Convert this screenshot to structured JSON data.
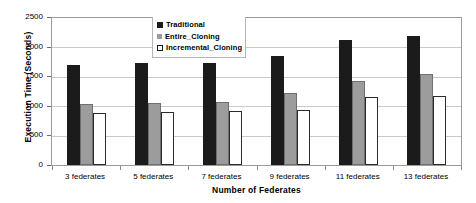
{
  "chart_data": {
    "type": "bar",
    "title": "",
    "xlabel": "Number of Federates",
    "ylabel": "Execution Time (Seconds)",
    "categories": [
      "3 federates",
      "5 federates",
      "7 federates",
      "9 federates",
      "11 federates",
      "13 federates"
    ],
    "series": [
      {
        "name": "Traditional",
        "color": "#1b1b1b",
        "values": [
          1700,
          1730,
          1730,
          1860,
          2120,
          2200
        ]
      },
      {
        "name": "Entire_Cloning",
        "color": "#9c9c9c",
        "values": [
          1040,
          1060,
          1070,
          1230,
          1430,
          1540
        ]
      },
      {
        "name": "Incremental_Cloning",
        "color": "#ffffff",
        "values": [
          890,
          900,
          920,
          940,
          1150,
          1180
        ]
      }
    ],
    "ylim": [
      0,
      2500
    ],
    "yticks": [
      0,
      500,
      1000,
      1500,
      2000,
      2500
    ],
    "ytick_labels": [
      "0",
      "500",
      "1000",
      "1500",
      "2000",
      "2500"
    ],
    "grid": true,
    "legend_position": "top-center"
  }
}
